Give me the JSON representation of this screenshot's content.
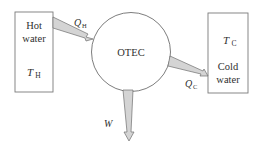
{
  "diagram": {
    "type": "heat-engine-energy-flow",
    "center_node": {
      "label": "OTEC"
    },
    "hot_reservoir": {
      "line1": "Hot",
      "line2": "water",
      "temp_symbol": "T",
      "temp_subscript": "H"
    },
    "cold_reservoir": {
      "line1": "Cold",
      "line2": "water",
      "temp_symbol": "T",
      "temp_subscript": "C"
    },
    "flows": {
      "heat_in": {
        "symbol": "Q",
        "subscript": "H",
        "direction": "hot water -> OTEC"
      },
      "heat_out": {
        "symbol": "Q",
        "subscript": "C",
        "direction": "OTEC -> cold water"
      },
      "work": {
        "symbol": "W",
        "direction": "OTEC -> down (output)"
      }
    },
    "colors": {
      "stroke": "#6e6e6e",
      "arrow_fill": "#d4d4d4",
      "background": "#ffffff"
    }
  }
}
